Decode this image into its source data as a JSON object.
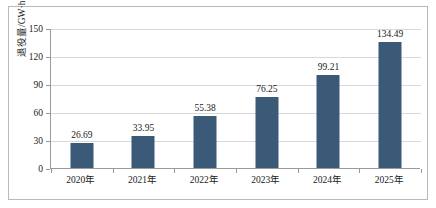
{
  "chart_data": {
    "type": "bar",
    "title": "",
    "xlabel": "",
    "ylabel": "退役量/GW·h",
    "categories": [
      "2020年",
      "2021年",
      "2022年",
      "2023年",
      "2024年",
      "2025年"
    ],
    "values": [
      26.69,
      33.95,
      55.38,
      76.25,
      99.21,
      134.49
    ],
    "value_labels": [
      "26.69",
      "33.95",
      "55.38",
      "76.25",
      "99.21",
      "134.49"
    ],
    "ylim": [
      0,
      150
    ],
    "yticks": [
      0,
      30,
      60,
      90,
      120,
      150
    ],
    "ytick_labels": [
      "0",
      "30",
      "60",
      "90",
      "120",
      "150"
    ],
    "grid": true,
    "legend": "none",
    "series": [
      {
        "name": "退役量",
        "values": [
          26.69,
          33.95,
          55.38,
          76.25,
          99.21,
          134.49
        ]
      }
    ],
    "colors": {
      "bar": "#3a5a77",
      "gridline": "#d8d8d8",
      "axis": "#9a9a9a",
      "frame": "#b9b9b9",
      "text": "#1a1a1a",
      "background": "#ffffff"
    }
  }
}
